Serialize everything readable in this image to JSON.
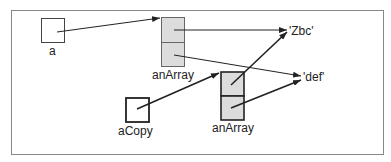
{
  "diagram": {
    "labels": {
      "a": "a",
      "anArray_top": "anArray",
      "aCopy": "aCopy",
      "anArray_bottom": "anArray",
      "zbc": "'Zbc'",
      "def": "'def'"
    },
    "colors": {
      "frame": "#888888",
      "box_fill_gray": "#dcdcdc",
      "stroke": "#222222"
    }
  }
}
